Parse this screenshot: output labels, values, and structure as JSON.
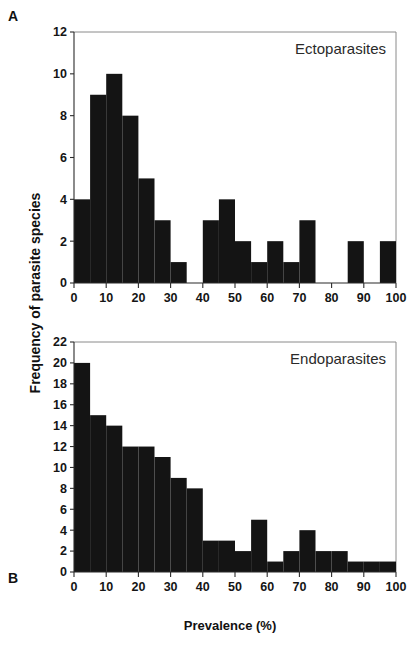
{
  "figure": {
    "panel_a_letter": "A",
    "panel_b_letter": "B",
    "y_axis_title": "Frequency of parasite species",
    "x_axis_title": "Prevalence (%)"
  },
  "chart_data": [
    {
      "type": "bar",
      "id": "panel-a",
      "panel": "A",
      "title": "Ectoparasites",
      "xlabel": "Prevalence (%)",
      "ylabel": "Frequency of parasite species",
      "xlim": [
        0,
        100
      ],
      "ylim": [
        0,
        12
      ],
      "bin_width": 5,
      "grid": false,
      "legend": "none",
      "annotation": "Ectoparasites",
      "annotation_position": "top-right inside axes",
      "xticks": [
        0,
        10,
        20,
        30,
        40,
        50,
        60,
        70,
        80,
        90,
        100
      ],
      "yticks": [
        0,
        2,
        4,
        6,
        8,
        10,
        12
      ],
      "xtick_labels": [
        "0",
        "10",
        "20",
        "30",
        "40",
        "50",
        "60",
        "70",
        "80",
        "90",
        "100"
      ],
      "ytick_labels": [
        "0",
        "2",
        "4",
        "6",
        "8",
        "10",
        "12"
      ],
      "categories": [
        "0-5",
        "5-10",
        "10-15",
        "15-20",
        "20-25",
        "25-30",
        "30-35",
        "35-40",
        "40-45",
        "45-50",
        "50-55",
        "55-60",
        "60-65",
        "65-70",
        "70-75",
        "75-80",
        "80-85",
        "85-90",
        "90-95",
        "95-100"
      ],
      "bin_edges": [
        0,
        5,
        10,
        15,
        20,
        25,
        30,
        35,
        40,
        45,
        50,
        55,
        60,
        65,
        70,
        75,
        80,
        85,
        90,
        95,
        100
      ],
      "values": [
        4,
        9,
        10,
        8,
        5,
        3,
        1,
        0,
        3,
        4,
        2,
        1,
        2,
        1,
        3,
        0,
        0,
        2,
        0,
        2
      ],
      "bar_color": "#141414"
    },
    {
      "type": "bar",
      "id": "panel-b",
      "panel": "B",
      "title": "Endoparasites",
      "xlabel": "Prevalence (%)",
      "ylabel": "Frequency of parasite species",
      "xlim": [
        0,
        100
      ],
      "ylim": [
        0,
        22
      ],
      "bin_width": 5,
      "grid": false,
      "legend": "none",
      "annotation": "Endoparasites",
      "annotation_position": "top-right inside axes",
      "xticks": [
        0,
        10,
        20,
        30,
        40,
        50,
        60,
        70,
        80,
        90,
        100
      ],
      "yticks": [
        0,
        2,
        4,
        6,
        8,
        10,
        12,
        14,
        16,
        18,
        20,
        22
      ],
      "xtick_labels": [
        "0",
        "10",
        "20",
        "30",
        "40",
        "50",
        "60",
        "70",
        "80",
        "90",
        "100"
      ],
      "ytick_labels": [
        "0",
        "2",
        "4",
        "6",
        "8",
        "10",
        "12",
        "14",
        "16",
        "18",
        "20",
        "22"
      ],
      "categories": [
        "0-5",
        "5-10",
        "10-15",
        "15-20",
        "20-25",
        "25-30",
        "30-35",
        "35-40",
        "40-45",
        "45-50",
        "50-55",
        "55-60",
        "60-65",
        "65-70",
        "70-75",
        "75-80",
        "80-85",
        "85-90",
        "90-95",
        "95-100"
      ],
      "bin_edges": [
        0,
        5,
        10,
        15,
        20,
        25,
        30,
        35,
        40,
        45,
        50,
        55,
        60,
        65,
        70,
        75,
        80,
        85,
        90,
        95,
        100
      ],
      "values": [
        20,
        15,
        14,
        12,
        12,
        11,
        9,
        8,
        3,
        3,
        2,
        5,
        1,
        2,
        4,
        2,
        2,
        1,
        1,
        1
      ],
      "bar_color": "#141414"
    }
  ]
}
